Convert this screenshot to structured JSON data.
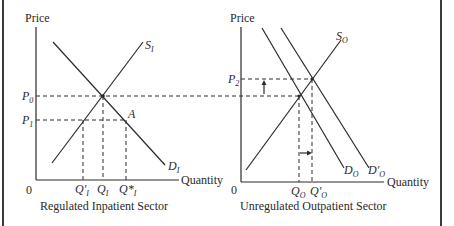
{
  "left_panel": {
    "y_axis_label": "Price",
    "x_axis_label": "Quantity",
    "origin": "0",
    "caption": "Regulated Inpatient Sector",
    "supply_label": {
      "main": "S",
      "sub": "I"
    },
    "demand_label": {
      "main": "D",
      "sub": "I"
    },
    "point_label": "A",
    "price_labels": [
      {
        "main": "P",
        "sub": "0"
      },
      {
        "main": "P",
        "sub": "1"
      }
    ],
    "quantity_labels": [
      {
        "main": "Q′",
        "sub": "I"
      },
      {
        "main": "Q",
        "sub": "I"
      },
      {
        "main": "Q*",
        "sub": "I"
      }
    ]
  },
  "right_panel": {
    "y_axis_label": "Price",
    "x_axis_label": "Quantity",
    "origin": "0",
    "caption": "Unregulated Outpatient Sector",
    "supply_label": {
      "main": "S",
      "sub": "O"
    },
    "demand_labels": [
      {
        "main": "D",
        "sub": "O"
      },
      {
        "main": "D′",
        "sub": "O"
      }
    ],
    "price_labels": [
      {
        "main": "P",
        "sub": "2"
      }
    ],
    "quantity_labels": [
      {
        "main": "Q",
        "sub": "O"
      },
      {
        "main": "Q′",
        "sub": "O"
      }
    ]
  },
  "colors": {
    "line": "#2a2a2a",
    "background": "#ffffff",
    "frame": "#3a3a3a"
  }
}
